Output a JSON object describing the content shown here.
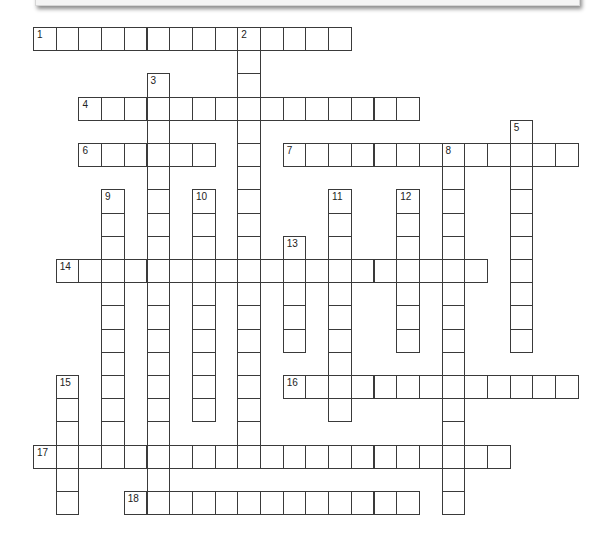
{
  "puzzle": {
    "type": "crossword",
    "grid": {
      "origin_x": 33,
      "origin_y": 27,
      "cell_w": 22.7,
      "cell_h": 23.2,
      "cols": 24,
      "rows": 21
    },
    "colors": {
      "border": "#3a3a3a",
      "cell_bg": "#ffffff",
      "number": "#222222"
    },
    "across": [
      {
        "number": "1",
        "row": 0,
        "col": 0,
        "length": 14
      },
      {
        "number": "4",
        "row": 3,
        "col": 2,
        "length": 15
      },
      {
        "number": "6",
        "row": 5,
        "col": 2,
        "length": 6
      },
      {
        "number": "7",
        "row": 5,
        "col": 11,
        "length": 13
      },
      {
        "number": "14",
        "row": 10,
        "col": 1,
        "length": 19
      },
      {
        "number": "16",
        "row": 15,
        "col": 11,
        "length": 13
      },
      {
        "number": "17",
        "row": 18,
        "col": 0,
        "length": 21
      },
      {
        "number": "18",
        "row": 20,
        "col": 4,
        "length": 13
      }
    ],
    "down": [
      {
        "number": "2",
        "row": 0,
        "col": 9,
        "length": 18
      },
      {
        "number": "3",
        "row": 2,
        "col": 5,
        "length": 19
      },
      {
        "number": "5",
        "row": 4,
        "col": 21,
        "length": 10
      },
      {
        "number": "8",
        "row": 5,
        "col": 18,
        "length": 16
      },
      {
        "number": "9",
        "row": 7,
        "col": 3,
        "length": 12
      },
      {
        "number": "10",
        "row": 7,
        "col": 7,
        "length": 10
      },
      {
        "number": "11",
        "row": 7,
        "col": 13,
        "length": 10
      },
      {
        "number": "12",
        "row": 7,
        "col": 16,
        "length": 7
      },
      {
        "number": "13",
        "row": 9,
        "col": 11,
        "length": 5
      },
      {
        "number": "15",
        "row": 15,
        "col": 1,
        "length": 6
      }
    ]
  }
}
